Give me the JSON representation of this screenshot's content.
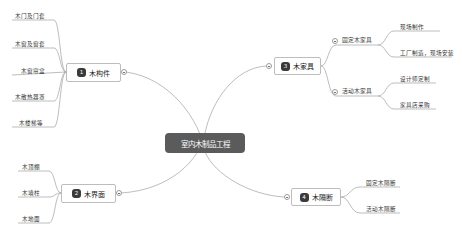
{
  "root": {
    "label": "室内木制品工程"
  },
  "branches": [
    {
      "number": "1",
      "label": "木构件",
      "children": [
        {
          "label": "木门及门套"
        },
        {
          "label": "木窗及窗套"
        },
        {
          "label": "木窗帘盒"
        },
        {
          "label": "木散热器罩"
        },
        {
          "label": "木楼梯等"
        }
      ]
    },
    {
      "number": "2",
      "label": "木界面",
      "children": [
        {
          "label": "木顶棚"
        },
        {
          "label": "木墙柱"
        },
        {
          "label": "木地面"
        }
      ]
    },
    {
      "number": "3",
      "label": "木家具",
      "children": [
        {
          "label": "固定木家具",
          "children": [
            {
              "label": "现场制作"
            },
            {
              "label": "工厂制造，现场安装"
            }
          ]
        },
        {
          "label": "活动木家具",
          "children": [
            {
              "label": "设计师定制"
            },
            {
              "label": "家具店采购"
            }
          ]
        }
      ]
    },
    {
      "number": "4",
      "label": "木隔断",
      "children": [
        {
          "label": "固定木隔断"
        },
        {
          "label": "活动木隔断"
        }
      ]
    }
  ],
  "colors": {
    "root_fill": "#5b5b5b",
    "line": "#9a9a9a",
    "badge": "#3a3a3a"
  }
}
